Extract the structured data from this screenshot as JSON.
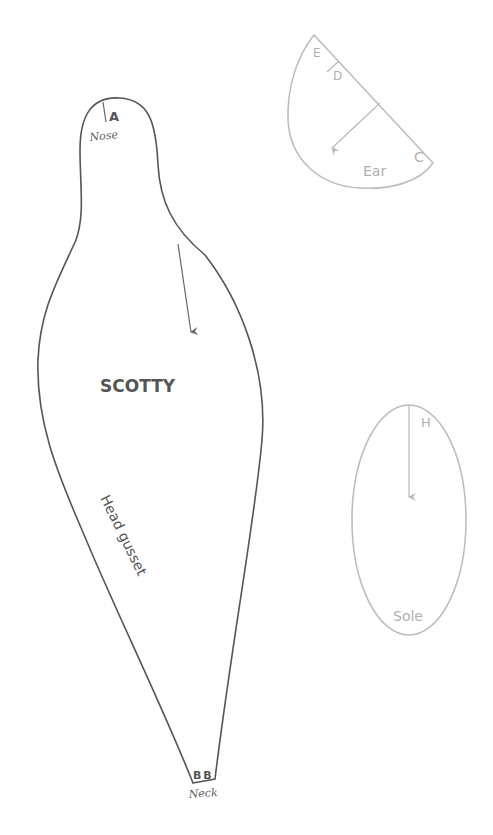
{
  "diagram": {
    "colors": {
      "main_piece": "#555555",
      "secondary_pieces": "#bdbdbd",
      "background": "#ffffff"
    },
    "pieces": {
      "head_gusset": {
        "name": "SCOTTY",
        "label": "Head gusset",
        "marks": {
          "top_letter": "A",
          "top_caption": "Nose",
          "bottom_letters": "B B",
          "bottom_caption": "Neck"
        },
        "grainline": "arrow"
      },
      "ear": {
        "label": "Ear",
        "marks": [
          "E",
          "D",
          "C"
        ],
        "grainline": "arrow"
      },
      "sole": {
        "label": "Sole",
        "marks": [
          "H"
        ],
        "grainline": "arrow"
      }
    }
  }
}
